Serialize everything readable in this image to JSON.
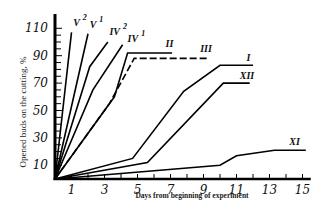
{
  "chart_data": {
    "type": "line",
    "title": "",
    "xlabel": "Days from beginning of experiment",
    "ylabel": "Opened buds on the cutting, %",
    "xlim": [
      0,
      15.5
    ],
    "ylim": [
      0,
      115
    ],
    "x_ticks": [
      1,
      3,
      5,
      7,
      9,
      11,
      13,
      15
    ],
    "y_ticks": [
      10,
      30,
      50,
      70,
      90,
      110
    ],
    "grid": false,
    "legend": "inline labels at line ends",
    "series": [
      {
        "name": "V2",
        "label": "V",
        "sup": "2",
        "style": "solid",
        "points": [
          [
            0,
            0
          ],
          [
            1.0,
            107
          ]
        ],
        "label_pos": [
          1.1,
          112
        ]
      },
      {
        "name": "V1",
        "label": "V",
        "sup": "1",
        "style": "solid",
        "points": [
          [
            0,
            0
          ],
          [
            2.0,
            106
          ]
        ],
        "label_pos": [
          2.1,
          110
        ]
      },
      {
        "name": "IV2",
        "label": "IV",
        "sup": "2",
        "style": "solid",
        "points": [
          [
            0,
            0
          ],
          [
            2.1,
            82
          ],
          [
            3.2,
            100
          ]
        ],
        "label_pos": [
          3.3,
          105
        ]
      },
      {
        "name": "IV1",
        "label": "IV",
        "sup": "1",
        "style": "solid",
        "points": [
          [
            0,
            0
          ],
          [
            2.3,
            65
          ],
          [
            4.1,
            98
          ]
        ],
        "label_pos": [
          4.4,
          100
        ]
      },
      {
        "name": "II",
        "label": "II",
        "sup": "",
        "style": "solid",
        "points": [
          [
            0,
            0
          ],
          [
            3.6,
            60
          ],
          [
            4.4,
            92
          ],
          [
            7.1,
            92
          ]
        ],
        "label_pos": [
          6.7,
          96
        ]
      },
      {
        "name": "III",
        "label": "III",
        "sup": "",
        "style": "dashed",
        "points": [
          [
            0,
            0
          ],
          [
            3.3,
            55
          ],
          [
            4.8,
            88
          ],
          [
            9.3,
            88
          ]
        ],
        "label_pos": [
          8.8,
          93
        ]
      },
      {
        "name": "I",
        "label": "I",
        "sup": "",
        "style": "solid",
        "points": [
          [
            0,
            0
          ],
          [
            4.7,
            15
          ],
          [
            7.8,
            64
          ],
          [
            10.0,
            83
          ],
          [
            12.0,
            83
          ]
        ],
        "label_pos": [
          11.6,
          86
        ]
      },
      {
        "name": "XII",
        "label": "XII",
        "sup": "",
        "style": "solid",
        "points": [
          [
            0,
            0
          ],
          [
            5.6,
            12
          ],
          [
            10.2,
            70
          ],
          [
            11.8,
            70
          ]
        ],
        "label_pos": [
          11.2,
          73
        ]
      },
      {
        "name": "XI",
        "label": "XI",
        "sup": "",
        "style": "solid",
        "points": [
          [
            0,
            0
          ],
          [
            10.0,
            10
          ],
          [
            11.0,
            17
          ],
          [
            13.3,
            21
          ],
          [
            15.2,
            21
          ]
        ],
        "label_pos": [
          14.2,
          25
        ]
      }
    ]
  }
}
